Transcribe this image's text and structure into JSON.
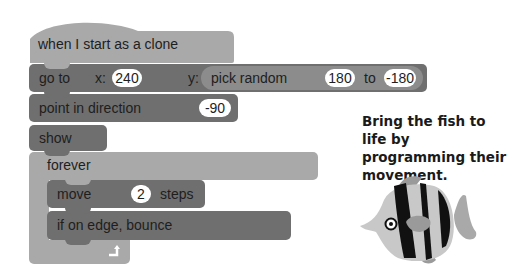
{
  "blocks": {
    "hat": {
      "label": "when I start as a clone"
    },
    "goto": {
      "label": "go to",
      "x_label": "x:",
      "x_value": "240",
      "y_label": "y:"
    },
    "pick_random": {
      "label": "pick random",
      "from": "180",
      "to_label": "to",
      "to": "-180"
    },
    "point": {
      "label": "point in direction",
      "value": "-90"
    },
    "show": {
      "label": "show"
    },
    "forever": {
      "label": "forever"
    },
    "move": {
      "label": "move",
      "value": "2",
      "suffix": "steps"
    },
    "bounce": {
      "label": "if on edge, bounce"
    }
  },
  "caption": "Bring the fish to life by programming their movement.",
  "colors": {
    "motion_block": "#6f6f6f",
    "control_block": "#a9a9a9",
    "event_block": "#a9a9a9",
    "reporter_block": "#8c8c8c"
  }
}
